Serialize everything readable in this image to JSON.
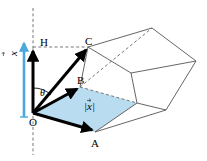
{
  "figure": {
    "background_color": "#ffffff",
    "width": 207,
    "height": 161,
    "colors": {
      "accent_blue": "#4aa8dd",
      "fill_blue": "#b9dcf0",
      "stroke_black": "#000000",
      "stroke_gray": "#555555",
      "dashed_gray": "#666666"
    },
    "labels": {
      "origin": "O",
      "point_a": "A",
      "point_b": "B",
      "point_c": "C",
      "point_h": "H",
      "angle_theta": "θ",
      "vector_x": "x",
      "magnitude_x": "|x|"
    },
    "geometry": {
      "origin": [
        33,
        113
      ],
      "point_a": [
        95,
        132
      ],
      "point_b": [
        80,
        87
      ],
      "point_c": [
        88,
        47
      ],
      "point_h": [
        33,
        47
      ],
      "axis_dashed_top": [
        33,
        8
      ],
      "axis_dashed_bottom": [
        33,
        155
      ],
      "blue_arrow_tail": [
        24,
        117
      ],
      "blue_arrow_head": [
        24,
        42
      ],
      "prism_top_far": [
        152,
        28
      ],
      "prism_right_far": [
        196,
        61
      ],
      "prism_mid_right": [
        131,
        73
      ],
      "prism_bottom_right": [
        166,
        110
      ],
      "prism_a_far": [
        137,
        103
      ]
    }
  }
}
